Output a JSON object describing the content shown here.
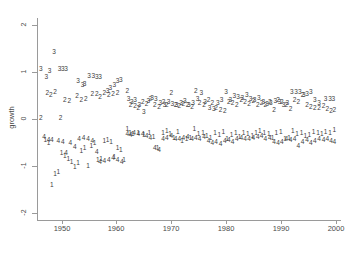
{
  "chart_data": {
    "type": "scatter",
    "title": "",
    "xlabel": "",
    "ylabel": "growth",
    "xlim": [
      1945.5,
      2001.0
    ],
    "ylim": [
      -2.15,
      2.15
    ],
    "grid": false,
    "legend": "none",
    "xticks": [
      1950,
      1960,
      1970,
      1980,
      1990,
      2000
    ],
    "xtick_labels": [
      "1950",
      "1960",
      "1970",
      "1980",
      "1990",
      "2000"
    ],
    "yticks": [
      2,
      1,
      0,
      -1,
      -2
    ],
    "ytick_labels": [
      "2",
      "1",
      "0",
      "-1",
      "-2"
    ],
    "marker_style": "series number as text glyph",
    "series": [
      {
        "name": "1",
        "label": "1",
        "points": [
          [
            1947.0,
            -0.45
          ],
          [
            1947.6,
            -0.52
          ],
          [
            1948.2,
            -1.4
          ],
          [
            1948.8,
            -1.18
          ],
          [
            1949.4,
            -1.14
          ],
          [
            1950.0,
            -0.72
          ],
          [
            1950.6,
            -0.8
          ],
          [
            1951.2,
            -0.85
          ],
          [
            1951.8,
            -0.92
          ],
          [
            1952.4,
            -1.02
          ],
          [
            1953.0,
            -0.95
          ],
          [
            1953.6,
            -0.68
          ],
          [
            1954.2,
            -0.62
          ],
          [
            1954.8,
            -1.0
          ],
          [
            1955.4,
            -0.58
          ],
          [
            1956.0,
            -0.52
          ],
          [
            1956.6,
            -0.88
          ],
          [
            1957.2,
            -0.85
          ],
          [
            1957.8,
            -0.48
          ],
          [
            1958.4,
            -0.46
          ],
          [
            1959.0,
            -0.5
          ],
          [
            1959.6,
            -0.82
          ],
          [
            1960.2,
            -0.62
          ],
          [
            1960.8,
            -0.66
          ],
          [
            1961.4,
            -0.88
          ],
          [
            1962.0,
            -0.22
          ],
          [
            1962.5,
            -0.3
          ],
          [
            1963.0,
            -0.33
          ],
          [
            1964.0,
            -0.31
          ],
          [
            1965.0,
            -0.35
          ],
          [
            1966.0,
            -0.3
          ],
          [
            1966.8,
            -0.38
          ],
          [
            1967.5,
            -0.62
          ],
          [
            1968.5,
            -0.3
          ],
          [
            1969.2,
            -0.27
          ],
          [
            1969.8,
            -0.33
          ],
          [
            1970.5,
            -0.4
          ],
          [
            1971.2,
            -0.28
          ],
          [
            1972.0,
            -0.48
          ],
          [
            1972.8,
            -0.44
          ],
          [
            1973.5,
            -0.4
          ],
          [
            1974.2,
            -0.22
          ],
          [
            1975.0,
            -0.33
          ],
          [
            1975.8,
            -0.3
          ],
          [
            1976.5,
            -0.36
          ],
          [
            1977.2,
            -0.4
          ],
          [
            1978.0,
            -0.3
          ],
          [
            1978.8,
            -0.34
          ],
          [
            1979.5,
            -0.28
          ],
          [
            1980.2,
            -0.42
          ],
          [
            1981.0,
            -0.34
          ],
          [
            1981.8,
            -0.3
          ],
          [
            1982.5,
            -0.38
          ],
          [
            1983.2,
            -0.3
          ],
          [
            1984.0,
            -0.32
          ],
          [
            1984.8,
            -0.36
          ],
          [
            1985.5,
            -0.3
          ],
          [
            1986.2,
            -0.26
          ],
          [
            1987.0,
            -0.3
          ],
          [
            1987.8,
            -0.33
          ],
          [
            1988.5,
            -0.4
          ],
          [
            1989.2,
            -0.3
          ],
          [
            1990.0,
            -0.28
          ],
          [
            1990.8,
            -0.44
          ],
          [
            1991.5,
            -0.4
          ],
          [
            1992.2,
            -0.26
          ],
          [
            1993.0,
            -0.33
          ],
          [
            1993.8,
            -0.3
          ],
          [
            1994.5,
            -0.36
          ],
          [
            1995.2,
            -0.34
          ],
          [
            1996.0,
            -0.28
          ],
          [
            1996.8,
            -0.3
          ],
          [
            1997.5,
            -0.33
          ],
          [
            1998.2,
            -0.28
          ],
          [
            1999.0,
            -0.3
          ],
          [
            1999.8,
            -0.24
          ]
        ]
      },
      {
        "name": "2",
        "label": "2",
        "points": [
          [
            1946.2,
            0.02
          ],
          [
            1947.4,
            0.55
          ],
          [
            1948.0,
            0.5
          ],
          [
            1948.8,
            0.56
          ],
          [
            1949.8,
            0.02
          ],
          [
            1950.6,
            0.4
          ],
          [
            1951.4,
            0.38
          ],
          [
            1952.8,
            0.48
          ],
          [
            1953.6,
            0.4
          ],
          [
            1954.4,
            0.42
          ],
          [
            1955.6,
            0.52
          ],
          [
            1956.4,
            0.52
          ],
          [
            1957.0,
            0.46
          ],
          [
            1957.8,
            0.55
          ],
          [
            1958.6,
            0.5
          ],
          [
            1959.4,
            0.52
          ],
          [
            1960.2,
            0.54
          ],
          [
            1962.0,
            0.6
          ],
          [
            1962.6,
            0.3
          ],
          [
            1963.4,
            0.28
          ],
          [
            1964.0,
            0.22
          ],
          [
            1964.8,
            0.35
          ],
          [
            1965.5,
            0.32
          ],
          [
            1966.2,
            0.42
          ],
          [
            1967.0,
            0.3
          ],
          [
            1967.8,
            0.25
          ],
          [
            1968.6,
            0.36
          ],
          [
            1969.2,
            0.3
          ],
          [
            1970.0,
            0.55
          ],
          [
            1970.8,
            0.3
          ],
          [
            1971.5,
            0.28
          ],
          [
            1972.2,
            0.32
          ],
          [
            1973.0,
            0.3
          ],
          [
            1973.8,
            0.26
          ],
          [
            1974.5,
            0.6
          ],
          [
            1975.2,
            0.34
          ],
          [
            1976.0,
            0.3
          ],
          [
            1976.8,
            0.4
          ],
          [
            1977.5,
            0.33
          ],
          [
            1978.2,
            0.22
          ],
          [
            1979.0,
            0.18
          ],
          [
            1979.8,
            0.16
          ],
          [
            1980.5,
            0.36
          ],
          [
            1981.2,
            0.34
          ],
          [
            1982.0,
            0.3
          ],
          [
            1982.8,
            0.4
          ],
          [
            1983.5,
            0.36
          ],
          [
            1984.2,
            0.32
          ],
          [
            1985.0,
            0.38
          ],
          [
            1985.8,
            0.3
          ],
          [
            1986.5,
            0.34
          ],
          [
            1987.2,
            0.3
          ],
          [
            1988.0,
            0.36
          ],
          [
            1988.8,
            0.18
          ],
          [
            1989.5,
            0.4
          ],
          [
            1990.2,
            0.36
          ],
          [
            1991.0,
            0.3
          ],
          [
            1991.8,
            0.2
          ],
          [
            1992.5,
            0.4
          ],
          [
            1993.2,
            0.36
          ],
          [
            1994.0,
            0.5
          ],
          [
            1994.8,
            0.3
          ],
          [
            1995.5,
            0.26
          ],
          [
            1996.2,
            0.22
          ],
          [
            1997.0,
            0.24
          ],
          [
            1997.8,
            0.28
          ],
          [
            1998.5,
            0.2
          ],
          [
            1999.2,
            0.16
          ],
          [
            1999.8,
            0.18
          ]
        ]
      },
      {
        "name": "3",
        "label": "3",
        "points": [
          [
            1946.2,
            1.05
          ],
          [
            1947.2,
            0.88
          ],
          [
            1947.8,
            1.02
          ],
          [
            1948.6,
            1.42
          ],
          [
            1949.6,
            1.05
          ],
          [
            1950.2,
            1.05
          ],
          [
            1950.8,
            1.05
          ],
          [
            1953.0,
            0.8
          ],
          [
            1953.8,
            0.72
          ],
          [
            1954.2,
            0.74
          ],
          [
            1955.0,
            0.92
          ],
          [
            1955.8,
            0.92
          ],
          [
            1956.4,
            0.88
          ],
          [
            1957.0,
            0.88
          ],
          [
            1958.4,
            0.6
          ],
          [
            1958.9,
            0.66
          ],
          [
            1959.6,
            0.72
          ],
          [
            1960.2,
            0.8
          ],
          [
            1960.8,
            0.82
          ],
          [
            1962.2,
            0.42
          ],
          [
            1962.8,
            0.36
          ],
          [
            1963.4,
            0.4
          ],
          [
            1964.2,
            0.3
          ],
          [
            1965.0,
            0.14
          ],
          [
            1965.8,
            0.38
          ],
          [
            1966.5,
            0.45
          ],
          [
            1967.2,
            0.42
          ],
          [
            1968.0,
            0.34
          ],
          [
            1968.8,
            0.3
          ],
          [
            1969.5,
            0.36
          ],
          [
            1970.2,
            0.32
          ],
          [
            1971.0,
            0.3
          ],
          [
            1971.8,
            0.34
          ],
          [
            1972.5,
            0.38
          ],
          [
            1973.2,
            0.3
          ],
          [
            1974.0,
            0.34
          ],
          [
            1974.8,
            0.42
          ],
          [
            1975.5,
            0.55
          ],
          [
            1976.2,
            0.36
          ],
          [
            1977.0,
            0.22
          ],
          [
            1977.8,
            0.2
          ],
          [
            1978.5,
            0.34
          ],
          [
            1979.2,
            0.4
          ],
          [
            1980.0,
            0.56
          ],
          [
            1980.8,
            0.4
          ],
          [
            1981.5,
            0.48
          ],
          [
            1982.2,
            0.46
          ],
          [
            1983.0,
            0.44
          ],
          [
            1983.8,
            0.5
          ],
          [
            1984.5,
            0.42
          ],
          [
            1985.2,
            0.4
          ],
          [
            1986.0,
            0.44
          ],
          [
            1986.8,
            0.36
          ],
          [
            1987.5,
            0.32
          ],
          [
            1988.2,
            0.34
          ],
          [
            1989.0,
            0.38
          ],
          [
            1989.8,
            0.36
          ],
          [
            1990.5,
            0.3
          ],
          [
            1991.2,
            0.34
          ],
          [
            1992.0,
            0.56
          ],
          [
            1992.8,
            0.56
          ],
          [
            1993.5,
            0.58
          ],
          [
            1994.2,
            0.5
          ],
          [
            1994.8,
            0.52
          ],
          [
            1995.5,
            0.56
          ],
          [
            1996.2,
            0.4
          ],
          [
            1997.0,
            0.34
          ],
          [
            1998.2,
            0.42
          ],
          [
            1999.0,
            0.42
          ],
          [
            1999.6,
            0.42
          ]
        ]
      },
      {
        "name": "4",
        "label": "4",
        "points": [
          [
            1946.8,
            -0.38
          ],
          [
            1947.6,
            -0.45
          ],
          [
            1948.2,
            -0.46
          ],
          [
            1949.4,
            -0.48
          ],
          [
            1950.2,
            -0.5
          ],
          [
            1950.8,
            -0.72
          ],
          [
            1951.6,
            -0.52
          ],
          [
            1952.4,
            -0.6
          ],
          [
            1953.2,
            -0.44
          ],
          [
            1954.0,
            -0.4
          ],
          [
            1954.8,
            -0.42
          ],
          [
            1955.6,
            -0.48
          ],
          [
            1956.4,
            -0.7
          ],
          [
            1957.0,
            -0.92
          ],
          [
            1957.8,
            -0.9
          ],
          [
            1958.6,
            -0.88
          ],
          [
            1959.4,
            -0.84
          ],
          [
            1960.2,
            -0.88
          ],
          [
            1961.0,
            -0.92
          ],
          [
            1962.0,
            -0.32
          ],
          [
            1962.6,
            -0.34
          ],
          [
            1963.2,
            -0.3
          ],
          [
            1964.0,
            -0.32
          ],
          [
            1964.8,
            -0.33
          ],
          [
            1965.5,
            -0.36
          ],
          [
            1966.2,
            -0.4
          ],
          [
            1967.0,
            -0.62
          ],
          [
            1967.8,
            -0.66
          ],
          [
            1968.5,
            -0.44
          ],
          [
            1969.2,
            -0.4
          ],
          [
            1970.0,
            -0.36
          ],
          [
            1970.8,
            -0.42
          ],
          [
            1971.5,
            -0.44
          ],
          [
            1972.2,
            -0.4
          ],
          [
            1973.0,
            -0.38
          ],
          [
            1973.8,
            -0.42
          ],
          [
            1974.5,
            -0.4
          ],
          [
            1975.2,
            -0.44
          ],
          [
            1976.0,
            -0.38
          ],
          [
            1976.8,
            -0.48
          ],
          [
            1977.5,
            -0.52
          ],
          [
            1978.2,
            -0.5
          ],
          [
            1979.0,
            -0.54
          ],
          [
            1979.8,
            -0.48
          ],
          [
            1980.5,
            -0.46
          ],
          [
            1981.2,
            -0.5
          ],
          [
            1982.0,
            -0.44
          ],
          [
            1982.8,
            -0.4
          ],
          [
            1983.5,
            -0.42
          ],
          [
            1984.2,
            -0.44
          ],
          [
            1985.0,
            -0.4
          ],
          [
            1985.8,
            -0.38
          ],
          [
            1986.5,
            -0.36
          ],
          [
            1987.2,
            -0.42
          ],
          [
            1988.0,
            -0.4
          ],
          [
            1988.8,
            -0.5
          ],
          [
            1989.5,
            -0.52
          ],
          [
            1990.2,
            -0.5
          ],
          [
            1991.0,
            -0.44
          ],
          [
            1991.8,
            -0.46
          ],
          [
            1992.5,
            -0.44
          ],
          [
            1993.2,
            -0.58
          ],
          [
            1994.0,
            -0.5
          ],
          [
            1994.8,
            -0.46
          ],
          [
            1995.5,
            -0.52
          ],
          [
            1996.2,
            -0.48
          ],
          [
            1997.0,
            -0.44
          ],
          [
            1997.8,
            -0.46
          ],
          [
            1998.5,
            -0.42
          ],
          [
            1999.2,
            -0.48
          ],
          [
            1999.8,
            -0.5
          ]
        ]
      }
    ]
  },
  "axes": {
    "y_title": "growth"
  },
  "colors": {
    "axis": "#9a9a9a",
    "text": "#4a4a4a",
    "marker": "#3d3d3d",
    "background": "#ffffff"
  }
}
